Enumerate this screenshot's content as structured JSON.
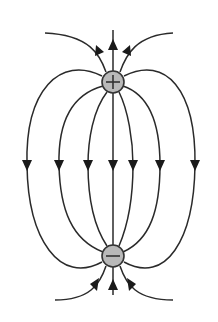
{
  "diagram": {
    "title": "Electric field lines of an electric dipole",
    "positive_charge": {
      "symbol": "+",
      "cx": 113,
      "cy": 82,
      "r": 11,
      "fill": "#b9b9b9"
    },
    "negative_charge": {
      "symbol": "−",
      "cx": 113,
      "cy": 256,
      "r": 11,
      "fill": "#b9b9b9"
    },
    "line_color": "#2a2a2a",
    "field_direction": "from positive (top) to negative (bottom)",
    "middle_arrow_count": 7,
    "top_arrow_count": 3,
    "bottom_arrow_count": 3
  }
}
